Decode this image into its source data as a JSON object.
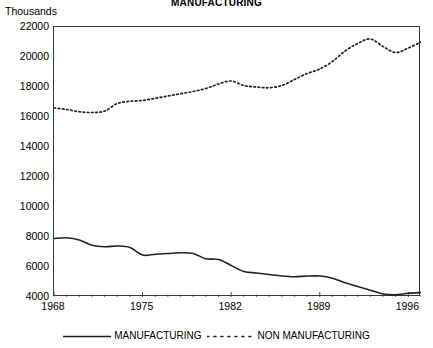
{
  "chart_data": {
    "type": "line",
    "title": "MANUFACTURING",
    "ylabel_caption": "Thousands",
    "xlabel": "",
    "ylabel": "",
    "xlim": [
      1968,
      1997
    ],
    "ylim": [
      4000,
      22000
    ],
    "grid": false,
    "legend_position": "bottom",
    "x_ticks": [
      1968,
      1975,
      1982,
      1989,
      1996
    ],
    "x_tick_labels": [
      "1968",
      "1975",
      "1982",
      "1989",
      "1996"
    ],
    "y_ticks": [
      4000,
      6000,
      8000,
      10000,
      12000,
      14000,
      16000,
      18000,
      20000,
      22000
    ],
    "y_tick_labels": [
      "4000",
      "6000",
      "8000",
      "10000",
      "12000",
      "14000",
      "16000",
      "18000",
      "20000",
      "22000"
    ],
    "x": [
      1968,
      1969,
      1970,
      1971,
      1972,
      1973,
      1974,
      1975,
      1976,
      1977,
      1978,
      1979,
      1980,
      1981,
      1982,
      1983,
      1984,
      1985,
      1986,
      1987,
      1988,
      1989,
      1990,
      1991,
      1992,
      1993,
      1994,
      1995,
      1996,
      1997
    ],
    "series": [
      {
        "name": "MANUFACTURING",
        "style": "solid",
        "color": "#222222",
        "values": [
          7900,
          7950,
          7800,
          7450,
          7350,
          7400,
          7300,
          6800,
          6850,
          6900,
          6950,
          6900,
          6550,
          6500,
          6100,
          5700,
          5600,
          5500,
          5400,
          5350,
          5400,
          5400,
          5250,
          4950,
          4700,
          4450,
          4200,
          4150,
          4250,
          4300
        ]
      },
      {
        "name": "NON MANUFACTURING",
        "style": "dotted",
        "color": "#222222",
        "values": [
          16600,
          16500,
          16350,
          16300,
          16400,
          16900,
          17050,
          17100,
          17250,
          17400,
          17550,
          17700,
          17900,
          18200,
          18400,
          18100,
          18000,
          17950,
          18100,
          18500,
          18900,
          19200,
          19700,
          20400,
          20900,
          21200,
          20700,
          20300,
          20600,
          21000
        ]
      }
    ]
  },
  "legend": {
    "entries": [
      {
        "label": "MANUFACTURING",
        "style": "solid"
      },
      {
        "label": "NON MANUFACTURING",
        "style": "dotted"
      }
    ]
  }
}
